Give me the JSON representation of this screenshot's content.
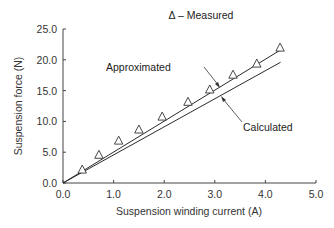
{
  "chart_data": {
    "type": "line",
    "title": "",
    "legend": "Δ – Measured",
    "xlabel": "Suspension winding current (A)",
    "ylabel": "Suspension force (N)",
    "xlim": [
      0.0,
      5.0
    ],
    "ylim": [
      0.0,
      25.0
    ],
    "xticks": [
      "0.0",
      "1.0",
      "2.0",
      "3.0",
      "4.0",
      "5.0"
    ],
    "yticks": [
      "0.0",
      "5.0",
      "10.0",
      "15.0",
      "20.0",
      "25.0"
    ],
    "grid": false,
    "series": [
      {
        "name": "Measured",
        "style": "triangle-markers",
        "x": [
          0.38,
          0.71,
          1.1,
          1.5,
          1.96,
          2.47,
          2.9,
          3.36,
          3.83,
          4.29
        ],
        "y": [
          2.1,
          4.5,
          6.8,
          8.6,
          10.7,
          13.1,
          15.1,
          17.5,
          19.3,
          21.9
        ]
      },
      {
        "name": "Approximated",
        "style": "line",
        "x": [
          0.0,
          4.3
        ],
        "y": [
          0.0,
          21.6
        ]
      },
      {
        "name": "Calculated",
        "style": "line",
        "x": [
          0.0,
          4.3
        ],
        "y": [
          0.0,
          19.6
        ]
      }
    ],
    "annotations": [
      {
        "text": "Approximated",
        "target_series": "Approximated"
      },
      {
        "text": "Calculated",
        "target_series": "Calculated"
      }
    ]
  }
}
